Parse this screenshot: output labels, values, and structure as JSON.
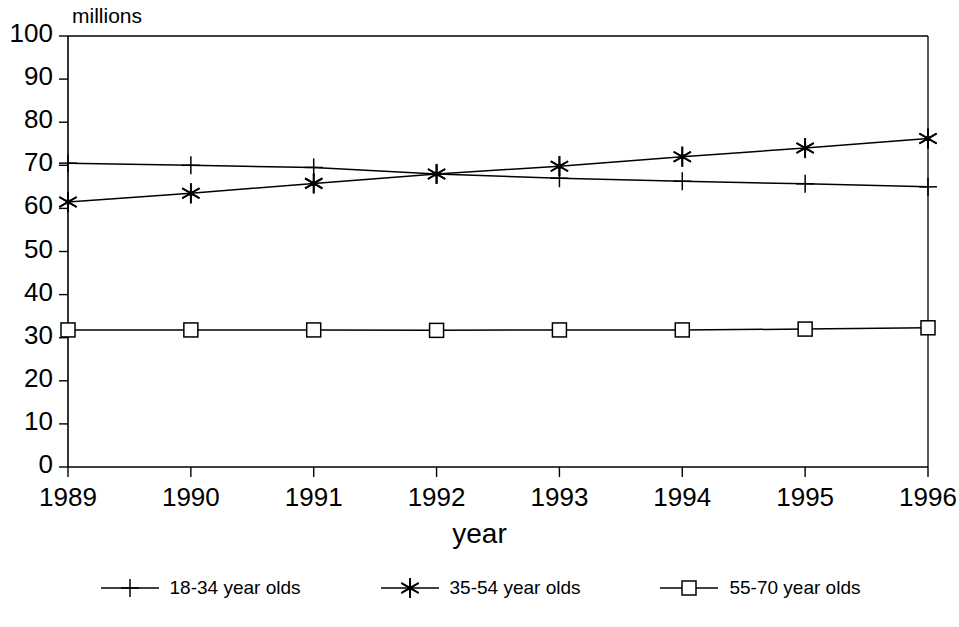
{
  "chart_data": {
    "type": "line",
    "title": "",
    "ylabel": "millions",
    "xlabel": "year",
    "categories": [
      "1989",
      "1990",
      "1991",
      "1992",
      "1993",
      "1994",
      "1995",
      "1996"
    ],
    "ylim": [
      0,
      100
    ],
    "yticks": [
      "0",
      "10",
      "20",
      "30",
      "40",
      "50",
      "60",
      "70",
      "80",
      "90",
      "100"
    ],
    "grid": false,
    "legend_position": "bottom",
    "series": [
      {
        "name": "18-34 year olds",
        "marker": "plus",
        "color": "#000000",
        "values": [
          70.5,
          70.0,
          69.5,
          68.0,
          67.0,
          66.3,
          65.7,
          65.0
        ]
      },
      {
        "name": "35-54 year olds",
        "marker": "asterisk",
        "color": "#000000",
        "values": [
          61.5,
          63.5,
          65.8,
          68.0,
          69.8,
          72.0,
          74.0,
          76.2
        ]
      },
      {
        "name": "55-70 year olds",
        "marker": "square",
        "color": "#000000",
        "values": [
          31.8,
          31.8,
          31.8,
          31.7,
          31.8,
          31.8,
          32.0,
          32.3
        ]
      }
    ]
  },
  "axis": {
    "y_unit_label": "millions",
    "x_title": "year"
  },
  "legend": {
    "items": [
      {
        "label": "18-34 year olds",
        "marker": "plus-marker"
      },
      {
        "label": "35-54 year olds",
        "marker": "asterisk-marker"
      },
      {
        "label": "55-70 year olds",
        "marker": "square-marker"
      }
    ]
  }
}
